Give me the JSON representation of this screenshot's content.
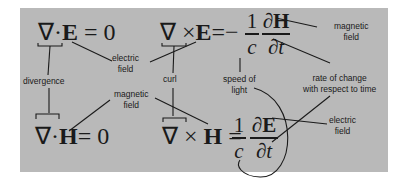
{
  "equations": {
    "gauss_e": {
      "nabla": "∇",
      "op": "·",
      "field": "E",
      "rhs": "= 0"
    },
    "faraday": {
      "nabla": "∇",
      "op": "×",
      "field": "E",
      "eq": "=",
      "sign": "−",
      "num1": "1",
      "den1": "c",
      "num2": "∂H",
      "den2": "∂t"
    },
    "gauss_h": {
      "nabla": "∇",
      "op": "·",
      "field": "H",
      "rhs": "= 0"
    },
    "ampere": {
      "nabla": "∇",
      "op": "×",
      "field": "H",
      "eq": "=",
      "num1": "1",
      "den1": "c",
      "num2": "∂E",
      "den2": "∂t"
    }
  },
  "labels": {
    "electric_field_top": [
      "electric",
      "field"
    ],
    "divergence": "divergence",
    "curl": "curl",
    "magnetic_field_top": [
      "magnetic",
      "field"
    ],
    "speed_of_light": [
      "speed of",
      "light"
    ],
    "rate_of_change": [
      "rate of change",
      "with respect to time"
    ],
    "magnetic_field_mid": [
      "magnetic",
      "field"
    ],
    "electric_field_bottom": [
      "electric",
      "field"
    ]
  },
  "colors": {
    "panel": "#b9b9b9",
    "ink": "#1a1a1a",
    "background": "#ffffff"
  }
}
